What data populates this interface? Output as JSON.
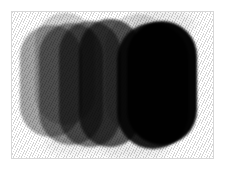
{
  "image": {
    "title": "Overlapping grayscale rounded shapes",
    "background_color": "#ffffff",
    "frame_color": "#d8d8d8",
    "texture": "diagonal-hatch",
    "texture_angle_deg": 115,
    "canvas": {
      "width": 229,
      "height": 172
    },
    "frame": {
      "x": 11,
      "y": 11,
      "width": 203,
      "height": 148
    }
  },
  "shapes": [
    {
      "name": "blob-1-light-gray",
      "color": "#9c9c9c",
      "opacity": 0.92,
      "x": 19,
      "y": 24,
      "width": 62,
      "height": 112,
      "radius": 31
    },
    {
      "name": "blob-2-pale-top",
      "color": "#c9c9c9",
      "opacity": 0.85,
      "x": 34,
      "y": 12,
      "width": 60,
      "height": 112,
      "radius": 30
    },
    {
      "name": "blob-3-medium-gray",
      "color": "#858585",
      "opacity": 0.9,
      "x": 38,
      "y": 22,
      "width": 64,
      "height": 122,
      "radius": 32
    },
    {
      "name": "blob-4-mid-dark",
      "color": "#6e6e6e",
      "opacity": 0.9,
      "x": 58,
      "y": 20,
      "width": 62,
      "height": 126,
      "radius": 31
    },
    {
      "name": "blob-5-dark-gray",
      "color": "#4a4a4a",
      "opacity": 0.92,
      "x": 78,
      "y": 18,
      "width": 62,
      "height": 128,
      "radius": 31
    },
    {
      "name": "blob-6-pale-highlight",
      "color": "#cfcfcf",
      "opacity": 0.7,
      "x": 104,
      "y": 13,
      "width": 66,
      "height": 120,
      "radius": 33
    },
    {
      "name": "blob-7-near-black",
      "color": "#131313",
      "opacity": 0.96,
      "x": 116,
      "y": 22,
      "width": 72,
      "height": 126,
      "radius": 36
    },
    {
      "name": "blob-8-black-foreground",
      "color": "#050505",
      "opacity": 1.0,
      "x": 126,
      "y": 20,
      "width": 70,
      "height": 124,
      "radius": 35
    }
  ],
  "halos": [
    {
      "name": "halo-top-right",
      "color": "#ededed",
      "x": 130,
      "y": 8,
      "width": 64,
      "height": 30
    },
    {
      "name": "halo-bottom-center",
      "color": "#ebebeb",
      "x": 96,
      "y": 134,
      "width": 72,
      "height": 24
    },
    {
      "name": "halo-bottom-left",
      "color": "#efefef",
      "x": 44,
      "y": 132,
      "width": 58,
      "height": 22
    }
  ]
}
